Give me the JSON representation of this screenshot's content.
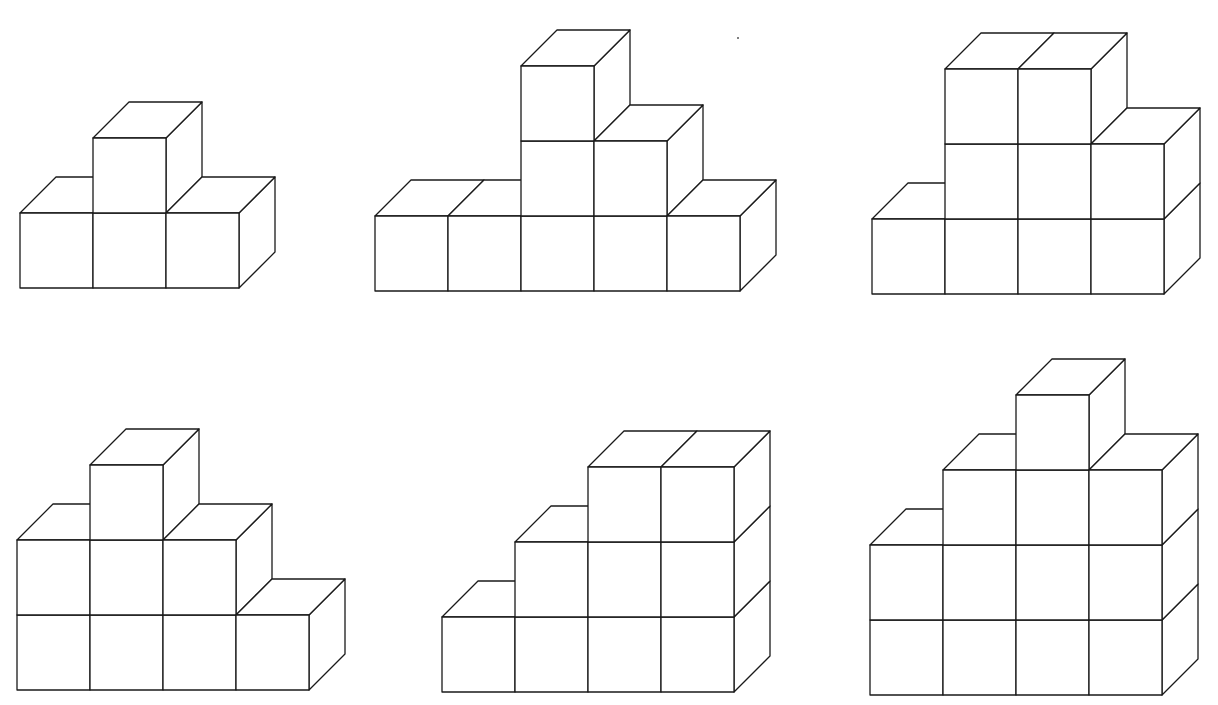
{
  "diagram": {
    "type": "isometric-cube-structures",
    "stroke_color": "#1a1a1a",
    "background": "#ffffff",
    "cube_size": {
      "width": 73,
      "height": 75
    },
    "depth_offset": {
      "dx": 36,
      "dy": -36
    },
    "figures": [
      {
        "id": "figure-1",
        "origin_x": 20,
        "base_y": 288,
        "column_heights": [
          1,
          2,
          1
        ],
        "total_visible_cubes": 4
      },
      {
        "id": "figure-2",
        "origin_x": 375,
        "base_y": 291,
        "column_heights": [
          1,
          1,
          3,
          2,
          1
        ],
        "total_visible_cubes": 8
      },
      {
        "id": "figure-3",
        "origin_x": 872,
        "base_y": 294,
        "column_heights": [
          1,
          3,
          3,
          2
        ],
        "total_visible_cubes": 9
      },
      {
        "id": "figure-4",
        "origin_x": 17,
        "base_y": 690,
        "column_heights": [
          2,
          3,
          2,
          1
        ],
        "total_visible_cubes": 8
      },
      {
        "id": "figure-5",
        "origin_x": 442,
        "base_y": 692,
        "column_heights": [
          1,
          2,
          3,
          3
        ],
        "total_visible_cubes": 9
      },
      {
        "id": "figure-6",
        "origin_x": 870,
        "base_y": 695,
        "column_heights": [
          2,
          3,
          4,
          3
        ],
        "total_visible_cubes": 12
      }
    ]
  }
}
